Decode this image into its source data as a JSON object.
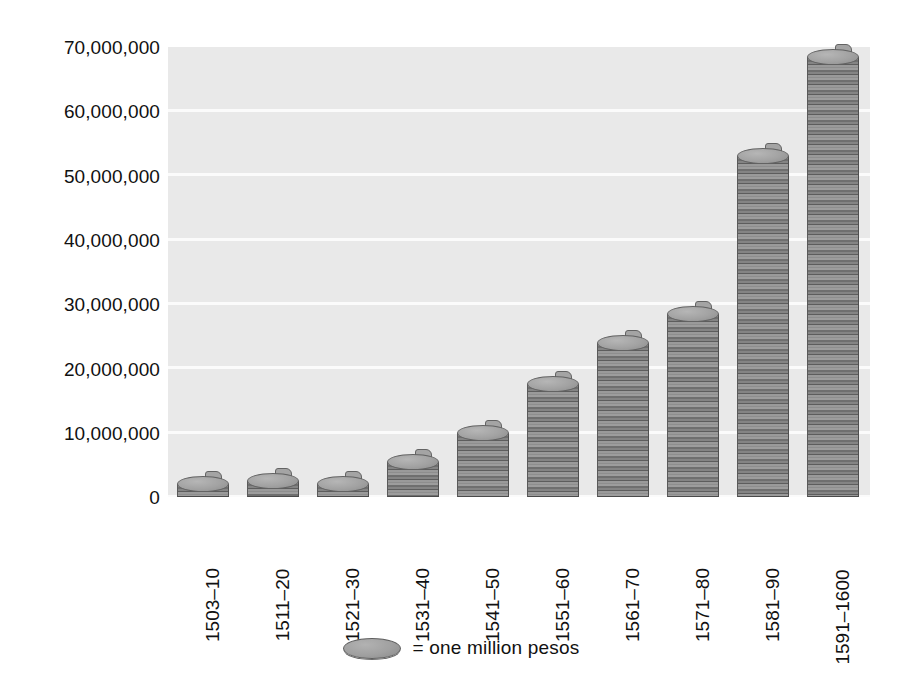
{
  "chart_data": {
    "type": "bar",
    "title": "",
    "subtitle": "",
    "xlabel": "",
    "ylabel": "",
    "categories": [
      "1503–10",
      "1511–20",
      "1521–30",
      "1531–40",
      "1541–50",
      "1551–60",
      "1561–70",
      "1571–80",
      "1581–90",
      "1591–1600"
    ],
    "values": [
      2000000,
      2500000,
      2000000,
      5500000,
      10000000,
      17500000,
      24000000,
      28500000,
      53000000,
      68500000
    ],
    "ylim": [
      0,
      70000000
    ],
    "ytick_values": [
      0,
      10000000,
      20000000,
      30000000,
      40000000,
      50000000,
      60000000,
      70000000
    ],
    "ytick_labels": [
      "0",
      "10,000,000",
      "20,000,000",
      "30,000,000",
      "40,000,000",
      "50,000,000",
      "60,000,000",
      "70,000,000"
    ],
    "grid": true,
    "grid_axis": "y",
    "legend_position": "bottom",
    "legend": [
      {
        "marker": "coin-icon",
        "label": "= one million pesos"
      }
    ],
    "series": [
      {
        "name": "pesos",
        "values": [
          2000000,
          2500000,
          2000000,
          5500000,
          10000000,
          17500000,
          24000000,
          28500000,
          53000000,
          68500000
        ]
      }
    ],
    "bar_style": "stacked-coins",
    "colors": {
      "plot_background": "#e9e9e9",
      "gridline": "#fbfbfb",
      "page_background": "#ffffff",
      "coin_face": "#a2a2a2",
      "coin_edge": "#6f6f6f",
      "text": "#111111"
    }
  },
  "legend": {
    "coin_icon": "coin-icon",
    "text": "= one million pesos"
  }
}
